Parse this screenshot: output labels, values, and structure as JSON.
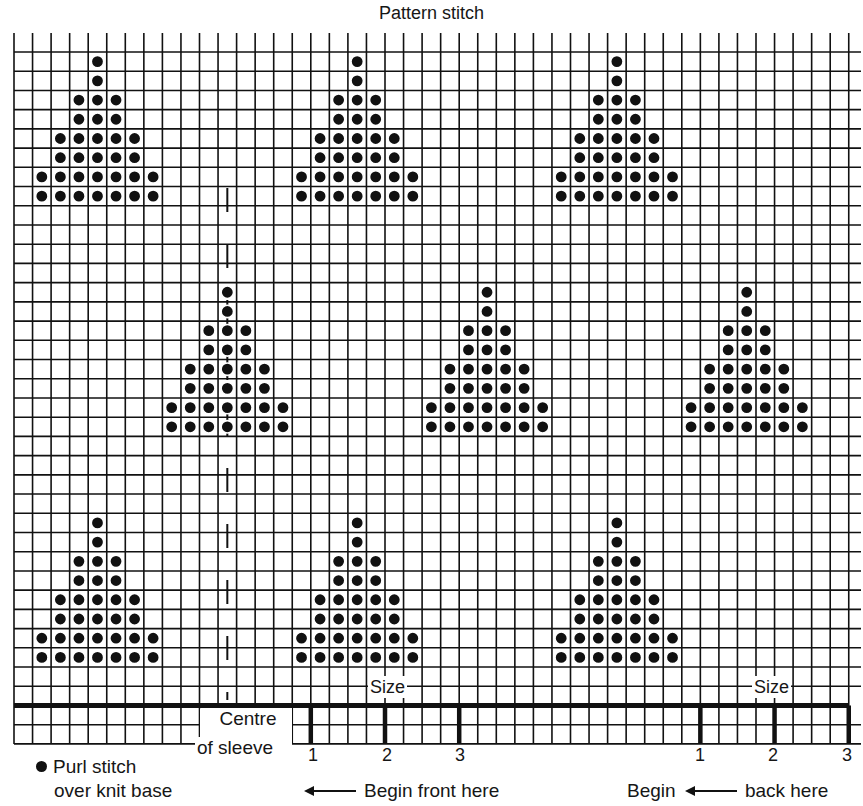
{
  "title": "Pattern stitch",
  "grid": {
    "origin_x": 14,
    "origin_y": 52,
    "cell_w": 18.55,
    "cell_h": 19.22,
    "cols": 46,
    "rows_above_base": 34,
    "rows_below_base": 2,
    "tick_top": 33,
    "line_color": "#111111",
    "base_line_color": "#111111"
  },
  "motif": {
    "name": "triangle",
    "row_widths": [
      1,
      1,
      3,
      3,
      5,
      5,
      7,
      7
    ],
    "stitch": "purl-dot"
  },
  "motif_positions": [
    {
      "apex_col": 4,
      "top_row": 0
    },
    {
      "apex_col": 18,
      "top_row": 0
    },
    {
      "apex_col": 32,
      "top_row": 0
    },
    {
      "apex_col": 11,
      "top_row": 12
    },
    {
      "apex_col": 25,
      "top_row": 12
    },
    {
      "apex_col": 39,
      "top_row": 12
    },
    {
      "apex_col": 4,
      "top_row": 24
    },
    {
      "apex_col": 18,
      "top_row": 24
    },
    {
      "apex_col": 32,
      "top_row": 24
    }
  ],
  "centre_line": {
    "col": 11,
    "from_y": 188,
    "to_y": 700
  },
  "size_markers": {
    "front": [
      {
        "label": "1",
        "col": 16
      },
      {
        "label": "2",
        "col": 20
      },
      {
        "label": "3",
        "col": 24
      }
    ],
    "back": [
      {
        "label": "1",
        "col": 37
      },
      {
        "label": "2",
        "col": 41
      },
      {
        "label": "3",
        "col": 45
      }
    ]
  },
  "labels": {
    "size_front": "Size",
    "size_back": "Size",
    "centre_line1": "Centre",
    "centre_line2": "of sleeve",
    "legend_line1": "Purl stitch",
    "legend_line2": "over knit base",
    "begin_front": "Begin front here",
    "begin_back_1": "Begin",
    "begin_back_2": "back here",
    "size_front_1": "1",
    "size_front_2": "2",
    "size_front_3": "3",
    "size_back_1": "1",
    "size_back_2": "2",
    "size_back_3": "3"
  },
  "legend": [
    {
      "symbol": "filled-dot",
      "meaning": "Purl stitch over knit base"
    }
  ]
}
